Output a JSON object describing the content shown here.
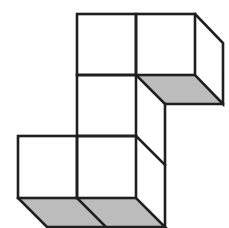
{
  "figure": {
    "type": "isometric-cube-net-diagram",
    "colors": {
      "stroke": "#1f1f1f",
      "shade": "#bcbcbc",
      "background": "#ffffff"
    },
    "cubes": [
      {
        "id": "top-left",
        "front": [
          77,
          14,
          136,
          75
        ]
      },
      {
        "id": "top-right",
        "front": [
          136,
          14,
          195,
          75
        ],
        "shaded_bottom": true,
        "right_side": true
      },
      {
        "id": "middle",
        "front": [
          77,
          75,
          136,
          136
        ],
        "right_side": true
      },
      {
        "id": "bottom-left",
        "front": [
          18,
          136,
          77,
          198
        ],
        "shaded_bottom": true
      },
      {
        "id": "bottom-middle",
        "front": [
          77,
          136,
          136,
          198
        ],
        "shaded_bottom": true,
        "right_side": true
      }
    ],
    "depth_offset": [
      29,
      29
    ]
  }
}
